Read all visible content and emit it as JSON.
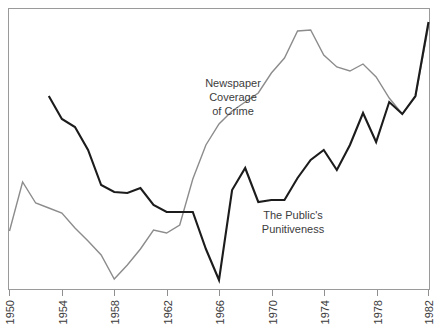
{
  "chart_data": {
    "type": "line",
    "title": "",
    "subtitle": "",
    "xlabel": "",
    "ylabel": "",
    "grid": false,
    "legend_position": "inline-annotations",
    "xlim": [
      1950,
      1982
    ],
    "ylim": [
      0,
      100
    ],
    "xticks": [
      "1950",
      "1954",
      "1958",
      "1962",
      "1966",
      "1970",
      "1974",
      "1978",
      "1982"
    ],
    "yticks": [],
    "annotations": [
      {
        "name": "newspaper-coverage-label",
        "lines": [
          "Newspaper",
          "Coverage",
          "of Crime"
        ],
        "x": 1967,
        "y": 76
      },
      {
        "name": "public-punitiveness-label",
        "lines": [
          "The Public's",
          "Punitiveness"
        ],
        "x": 1972,
        "y": 28
      }
    ],
    "series": [
      {
        "name": "Newspaper Coverage of Crime",
        "color": "#8c8c8c",
        "width": 1.4,
        "x": [
          1950,
          1951,
          1952,
          1953,
          1954,
          1955,
          1956,
          1957,
          1958,
          1959,
          1960,
          1961,
          1962,
          1963,
          1964,
          1965,
          1966,
          1967,
          1968,
          1969,
          1970,
          1971,
          1972,
          1973,
          1974,
          1975,
          1976,
          1977,
          1978,
          1979,
          1980,
          1981,
          1982
        ],
        "values": [
          21,
          38,
          29,
          27,
          25,
          20,
          17,
          14,
          11,
          15,
          19,
          25,
          24,
          27,
          42,
          53,
          60,
          64,
          67,
          70,
          76,
          80,
          89,
          92,
          83,
          78,
          77,
          79,
          74,
          66,
          59,
          66,
          88
        ],
        "y_px": [
          231,
          182,
          203,
          208,
          213,
          228,
          241,
          255,
          279,
          265,
          249,
          230,
          233,
          225,
          179,
          145,
          124,
          111,
          102,
          93,
          73,
          58,
          31,
          30,
          55,
          67,
          71,
          64,
          77,
          98,
          114,
          97,
          26
        ]
      },
      {
        "name": "The Public's Punitiveness",
        "color": "#1c1c1c",
        "width": 2.1,
        "x": [
          1953,
          1954,
          1955,
          1956,
          1957,
          1958,
          1959,
          1960,
          1961,
          1962,
          1963,
          1964,
          1965,
          1966,
          1967,
          1968,
          1969,
          1970,
          1971,
          1972,
          1973,
          1974,
          1975,
          1976,
          1977,
          1978,
          1979,
          1980,
          1981,
          1982
        ],
        "values": [
          74,
          66,
          63,
          55,
          44,
          41,
          41,
          43,
          36,
          33,
          33,
          33,
          17,
          6,
          31,
          41,
          37,
          38,
          38,
          46,
          52,
          56,
          45,
          57,
          68,
          58,
          72,
          66,
          75,
          90
        ],
        "y_px": [
          96,
          119,
          127,
          150,
          185,
          192,
          193,
          188,
          205,
          212,
          212,
          212,
          249,
          280,
          190,
          168,
          202,
          200,
          200,
          178,
          160,
          150,
          170,
          145,
          113,
          142,
          102,
          114,
          96,
          22
        ]
      }
    ]
  },
  "axis": {
    "name": "x-axis",
    "ticks": [
      "1950",
      "1954",
      "1958",
      "1962",
      "1966",
      "1970",
      "1974",
      "1978",
      "1982"
    ],
    "tick_rotation": -90
  },
  "labels": {
    "newspaper": {
      "line1": "Newspaper",
      "line2": "Coverage",
      "line3": "of Crime"
    },
    "punitiveness": {
      "line1": "The Public's",
      "line2": "Punitiveness"
    }
  },
  "colors": {
    "gray_series": "#8c8c8c",
    "black_series": "#1c1c1c",
    "frame": "#9a9a9a",
    "background": "#ffffff",
    "text": "#3a3a3a"
  }
}
